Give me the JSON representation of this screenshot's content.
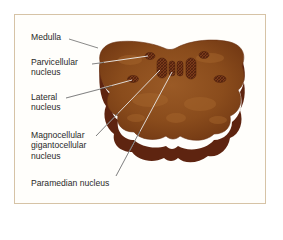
{
  "figure": {
    "labels": {
      "medulla": "Medulla",
      "parvicellular": "Parvicellular\nnucleus",
      "lateral": "Lateral\nnucleus",
      "magnocellular": "Magnocellular\ngigantocellular\nnucleus",
      "paramedian": "Paramedian nucleus"
    },
    "colors": {
      "top_surface": "#8a4e1c",
      "side_surface": "#5e2410",
      "nucleus_fill": "#6b3318",
      "leader_line": "#3a3a3a",
      "frame_border": "#d6c3a6"
    }
  }
}
